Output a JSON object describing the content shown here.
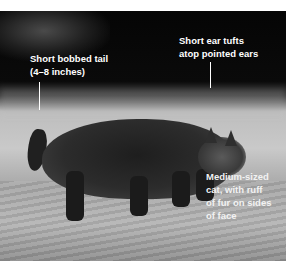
{
  "image": {
    "subject": "Bobcat walking across a grassy field (grayscale photo)",
    "background_color": "#ffffff",
    "text_color": "#ffffff"
  },
  "annotations": {
    "tail": {
      "lines": [
        "Short bobbed tail",
        "(4–8 inches)"
      ]
    },
    "ears": {
      "lines": [
        "Short ear tufts",
        "atop pointed ears"
      ]
    },
    "face": {
      "lines": [
        "Medium-sized",
        "cat, with ruff",
        "of fur on sides",
        "of face"
      ]
    }
  }
}
